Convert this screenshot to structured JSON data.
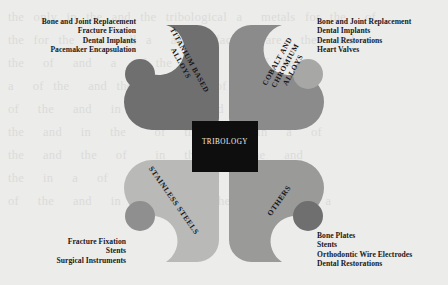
{
  "figure": {
    "center": {
      "label": "TRIBOLOGY",
      "color": "#0e0e0e",
      "text_color": "#f2f2f0"
    },
    "background_color": "#ececea",
    "quadrants": [
      {
        "id": "titanium",
        "position": "top-left",
        "label": "TITANIUM BASED ALLOYS",
        "label_line1": "TITANIUM BASED",
        "label_line2": "ALLOYS",
        "color": "#6f6f70",
        "applications": [
          "Bone and Joint Replacement",
          "Fracture Fixation",
          "Dental Implants",
          "Pacemaker Encapsulation"
        ]
      },
      {
        "id": "cobalt-chromium",
        "position": "top-right",
        "label": "COBALT AND CHROMIUM ALLOYS",
        "label_line1": "COBALT AND",
        "label_line2": "CHROMIUM",
        "label_line3": "ALLOYS",
        "color": "#8b8b8c",
        "applications": [
          "Bone and Joint Replacement",
          "Dental Implants",
          "Dental Restorations",
          "Heart Valves"
        ]
      },
      {
        "id": "stainless-steels",
        "position": "bottom-left",
        "label": "STAINLESS STEELS",
        "color": "#b9b9b7",
        "applications": [
          "Fracture Fixation",
          "Stents",
          "Surgical Instruments"
        ]
      },
      {
        "id": "others",
        "position": "bottom-right",
        "label": "OTHERS",
        "color": "#9a9a99",
        "applications": [
          "Bone Plates",
          "Stents",
          "Orthodontic Wire Electrodes",
          "Dental Restorations"
        ]
      }
    ],
    "watermark_text": "the only in the and the tribological a  metals for the  of\nthe for the  as well a  and surface   are  the  and a\nthe  of  and  a  of the  and  in  of the\na  of the  and the  in  the  of the  and\nof  the  and  in   of the  and  a  of\nthe  and  in  the   of  the  and  in  a  of\nthe  and  the  of   in  the  of  the  and\nthe  in  a  of  the   and  of  the  and  a\nof  the  and  in  the   of  the  and   in  a"
  }
}
